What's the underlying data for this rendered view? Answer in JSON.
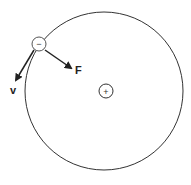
{
  "diagram": {
    "orbit": {
      "cx": 104,
      "cy": 91,
      "r": 79
    },
    "nucleus": {
      "cx": 106,
      "cy": 91,
      "r": 7,
      "sign": "+"
    },
    "electron": {
      "cx": 39,
      "cy": 44,
      "r": 7,
      "sign": "−"
    },
    "vectors": [
      {
        "name": "force",
        "label": "F"
      },
      {
        "name": "velocity",
        "label": "v"
      }
    ],
    "colors": {
      "stroke": "#333333",
      "background": "#ffffff"
    }
  }
}
